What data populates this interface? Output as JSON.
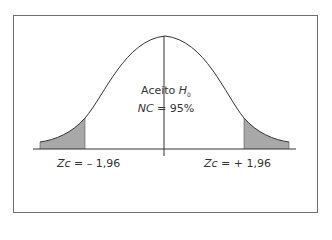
{
  "diagram": {
    "type": "normal-distribution-two-tailed",
    "center_label": {
      "line1_prefix": "Aceito",
      "line1_var": "H",
      "line1_sub": "0",
      "line2_var": "NC",
      "line2_rest": " = 95%"
    },
    "left_critical": {
      "var": "Zc",
      "rest": " = – 1,96"
    },
    "right_critical": {
      "var": "Zc",
      "rest": " = + 1,96"
    },
    "colors": {
      "shade": "#a8a8a8",
      "line": "#333333",
      "frame": "#6e6e6e"
    }
  }
}
